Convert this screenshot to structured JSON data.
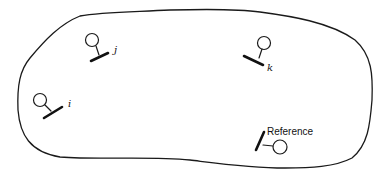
{
  "diagram": {
    "title": "",
    "region": {
      "name": "closed-region",
      "description": "Irregular closed boundary enclosing all stations"
    },
    "stations": [
      {
        "id": "j",
        "label": "j",
        "label_style": "italic",
        "role": "station"
      },
      {
        "id": "k",
        "label": "k",
        "label_style": "italic",
        "role": "station"
      },
      {
        "id": "i",
        "label": "i",
        "label_style": "italic",
        "role": "station"
      },
      {
        "id": "reference",
        "label": "Reference",
        "label_style": "upright",
        "role": "reference-station"
      }
    ],
    "colors": {
      "stroke": "#1a1a1a",
      "background": "#ffffff"
    }
  }
}
